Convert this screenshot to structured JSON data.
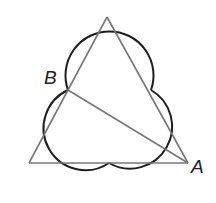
{
  "diagram": {
    "labels": {
      "B": "B",
      "A": "A"
    },
    "colors": {
      "arc": "#1e1e1e",
      "segment": "#777777"
    }
  }
}
